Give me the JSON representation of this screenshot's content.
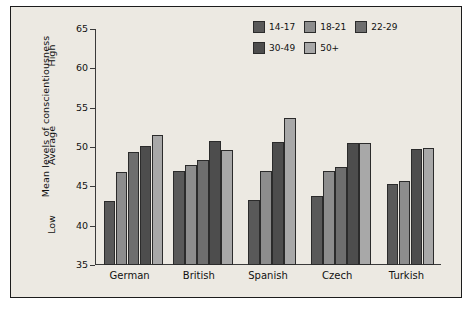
{
  "chart_data": {
    "type": "bar",
    "title": "",
    "xlabel": "",
    "ylabel": "Mean levels of conscientiousness",
    "ylim": [
      35,
      65
    ],
    "yticks": [
      35,
      40,
      45,
      50,
      55,
      60,
      65
    ],
    "ytick_labels": [
      "35",
      "40",
      "45",
      "50",
      "55",
      "60",
      "65"
    ],
    "zone_labels": [
      {
        "text": "Low",
        "value": 40
      },
      {
        "text": "Average",
        "value": 50
      },
      {
        "text": "High",
        "value": 61.5
      }
    ],
    "grid": false,
    "legend_position": "top-right",
    "categories": [
      "German",
      "British",
      "Spanish",
      "Czech",
      "Turkish"
    ],
    "series": [
      {
        "name": "14-17",
        "color": "#595959",
        "values": [
          43.2,
          47.0,
          43.3,
          43.8,
          45.3
        ]
      },
      {
        "name": "18-21",
        "color": "#8d8d8d",
        "values": [
          46.8,
          47.7,
          46.9,
          47.0,
          45.7
        ]
      },
      {
        "name": "22-29",
        "color": "#6e6e6e",
        "values": [
          49.4,
          48.4,
          null,
          47.4,
          null
        ]
      },
      {
        "name": "30-49",
        "color": "#4d4d4d",
        "values": [
          50.1,
          50.8,
          50.7,
          50.5,
          49.8
        ]
      },
      {
        "name": "50+",
        "color": "#a8a8a8",
        "values": [
          51.5,
          49.6,
          53.7,
          50.5,
          49.9
        ]
      }
    ]
  },
  "legend": {
    "row1": [
      "14-17",
      "18-21",
      "22-29"
    ],
    "row2": [
      "30-49",
      "50+"
    ]
  },
  "caption": ""
}
